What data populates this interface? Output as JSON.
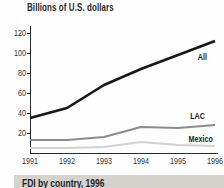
{
  "chart_data": {
    "type": "line",
    "title": "Billions of U.S. dollars",
    "xlabel": "",
    "ylabel": "Billions of U.S. dollars",
    "categories": [
      "1991",
      "1992",
      "1993",
      "1994",
      "1995",
      "1996"
    ],
    "yticks": [
      20,
      40,
      60,
      80,
      100,
      120
    ],
    "ylim": [
      0,
      125
    ],
    "grid": false,
    "legend_position": "end-of-line-labels",
    "axis_color": "#2b2b2b",
    "tick_label_color": "#333333",
    "series": [
      {
        "name": "All",
        "values": [
          35,
          45,
          68,
          84,
          98,
          112
        ],
        "color": "#171717",
        "width": 2.6
      },
      {
        "name": "LAC",
        "values": [
          13,
          13,
          16,
          26,
          25,
          28
        ],
        "color": "#8c8c8c",
        "width": 2.2
      },
      {
        "name": "Mexico",
        "values": [
          5,
          5,
          6,
          11,
          8,
          7
        ],
        "color": "#d2d2d2",
        "width": 2.2
      }
    ]
  },
  "section_header": {
    "title": "FDI by country, 1996",
    "background": "#d6d3cf"
  }
}
